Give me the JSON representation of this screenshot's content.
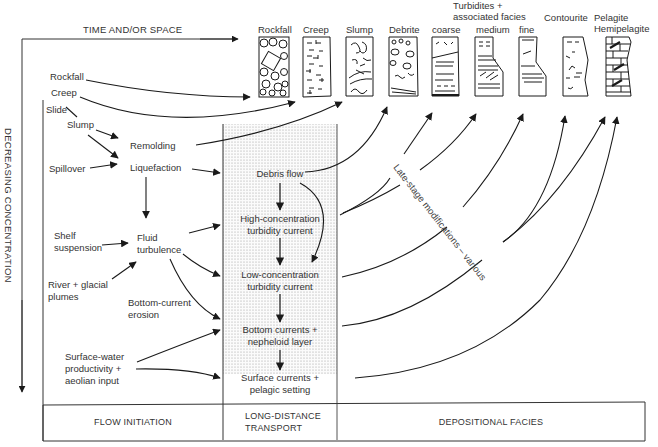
{
  "axes": {
    "horizontal": "TIME AND/OR SPACE",
    "vertical": "DECREASING CONCENTRATION"
  },
  "facies_columns": [
    {
      "label": "Rockfall",
      "pattern": "boulders"
    },
    {
      "label": "Creep",
      "pattern": "dashes-crosses"
    },
    {
      "label": "Slump",
      "pattern": "folded-swirls"
    },
    {
      "label": "Debrite",
      "pattern": "clasts-in-matrix"
    },
    {
      "label": "coarse",
      "pattern": "coarse-turbidite"
    },
    {
      "label": "medium",
      "pattern": "medium-turbidite"
    },
    {
      "label": "fine",
      "pattern": "fine-turbidite"
    },
    {
      "label": "Contourite",
      "pattern": "contourite"
    },
    {
      "label": "Pelagite\nHemipelagite",
      "label_line1": "Pelagite",
      "label_line2": "Hemipelagite",
      "pattern": "brick-burrows"
    }
  ],
  "turbidites_group": {
    "line1": "Turbidites +",
    "line2": "associated facies"
  },
  "initiation": {
    "rockfall": "Rockfall",
    "creep": "Creep",
    "slide": "Slide",
    "slump": "Slump",
    "remolding": "Remolding",
    "spillover": "Spillover",
    "liquefaction": "Liquefaction",
    "shelf_suspension_1": "Shelf",
    "shelf_suspension_2": "suspension",
    "fluid_turbulence_1": "Fluid",
    "fluid_turbulence_2": "turbulence",
    "river_plumes_1": "River + glacial",
    "river_plumes_2": "plumes",
    "bottom_erosion_1": "Bottom-current",
    "bottom_erosion_2": "erosion",
    "surface_water_1": "Surface-water",
    "surface_water_2": "productivity +",
    "surface_water_3": "aeolian input"
  },
  "transport": {
    "debris_flow": "Debris flow",
    "high_conc_1": "High-concentration",
    "high_conc_2": "turbidity current",
    "low_conc_1": "Low-concentration",
    "low_conc_2": "turbidity current",
    "bottom_currents_1": "Bottom currents +",
    "bottom_currents_2": "nepheloid layer",
    "surface_currents_1": "Surface currents +",
    "surface_currents_2": "pelagic setting"
  },
  "annotation": "Late-stage modifications – various",
  "footer": {
    "flow_initiation": "FLOW INITIATION",
    "transport_1": "LONG-DISTANCE",
    "transport_2": "TRANSPORT",
    "depositional": "DEPOSITIONAL FACIES"
  },
  "colors": {
    "ink": "#1a1a1a",
    "text": "#333333",
    "stipple": "#c8c8c8"
  }
}
